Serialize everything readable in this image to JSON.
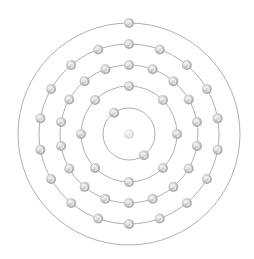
{
  "diagram": {
    "type": "bohr-model",
    "element": "",
    "center": [
      129,
      134
    ],
    "colors": {
      "background": "#ffffff",
      "orbit": "#9a9a9a",
      "electron_fill": "#c4c4c4",
      "electron_shade": "#a8a8a8",
      "electron_highlight": "#f2f2f2",
      "nucleus_fill": "#e2e2e2"
    },
    "nucleus": {
      "radius": 5
    },
    "electron_radius": 5,
    "shells": [
      {
        "name": "shell-1",
        "radius": 26,
        "electrons": 2,
        "start_angle": -125
      },
      {
        "name": "shell-2",
        "radius": 48,
        "electrons": 8,
        "start_angle": -90
      },
      {
        "name": "shell-3",
        "radius": 69,
        "electrons": 18,
        "start_angle": -90
      },
      {
        "name": "shell-4",
        "radius": 90,
        "electrons": 18,
        "start_angle": -90
      },
      {
        "name": "shell-5",
        "radius": 111,
        "electrons": 1,
        "start_angle": -90
      }
    ]
  }
}
